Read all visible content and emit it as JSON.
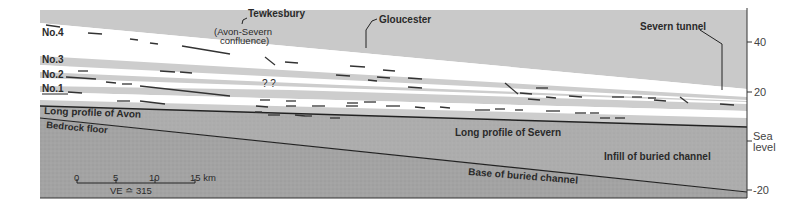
{
  "colors": {
    "sky_band": "#c9c9c9",
    "terrace_white": "#ffffff",
    "terrace_grey": "#cdcdcd",
    "alluvium": "#bdbdbd",
    "infill": "#a9a9a9",
    "bedrock": "#9a9a9a",
    "line": "#222222"
  },
  "terraces": {
    "no4": "No.4",
    "no3": "No.3",
    "no2": "No.2",
    "no1": "No.1"
  },
  "places": {
    "tewkesbury": "Tewkesbury",
    "confluence_line1": "(Avon-Severn",
    "confluence_line2": "confluence)",
    "gloucester": "Gloucester",
    "severn_tunnel": "Severn tunnel"
  },
  "uncertain_marks": "? ?",
  "profiles": {
    "avon": "Long profile of Avon",
    "severn": "Long profile of Severn",
    "bedrock_floor": "Bedrock floor",
    "infill": "Infill of buried channel",
    "base": "Base of buried channel"
  },
  "axis": {
    "ticks": [
      {
        "label": "40",
        "value": 40
      },
      {
        "label": "20",
        "value": 20
      },
      {
        "label": "Sea",
        "label2": "level",
        "value": 0
      },
      {
        "label": "-20",
        "value": -20
      }
    ],
    "units_note": "metres"
  },
  "scale_bar": {
    "ticks": [
      "0",
      "5",
      "10",
      "15 km"
    ],
    "ve_label": "VE ≏ 315"
  }
}
